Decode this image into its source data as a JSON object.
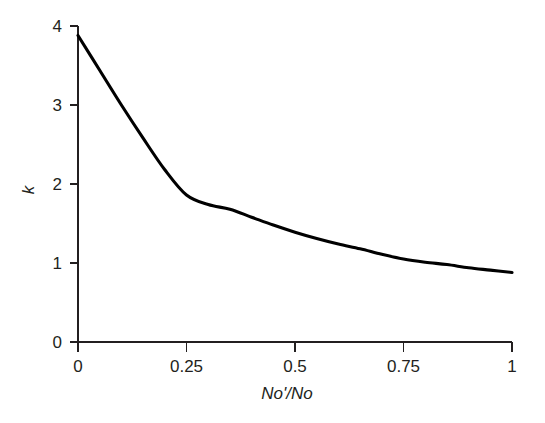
{
  "chart_data": {
    "type": "line",
    "title": "",
    "subtitle": "",
    "xlabel": "No'/No",
    "ylabel": "k",
    "xlim": [
      0,
      1
    ],
    "ylim": [
      0,
      4
    ],
    "grid": false,
    "legend": null,
    "legend_position": "none",
    "x_ticks": [
      0,
      0.25,
      0.5,
      0.75,
      1
    ],
    "x_tick_labels": [
      "0",
      "0.25",
      "0.5",
      "0.75",
      "1"
    ],
    "y_ticks": [
      0,
      1,
      2,
      3,
      4
    ],
    "y_tick_labels": [
      "0",
      "1",
      "2",
      "3",
      "4"
    ],
    "series": [
      {
        "name": "k",
        "color": "#000000",
        "x": [
          0.0,
          0.05,
          0.1,
          0.15,
          0.2,
          0.25,
          0.3,
          0.35,
          0.4,
          0.45,
          0.5,
          0.55,
          0.6,
          0.65,
          0.7,
          0.75,
          0.8,
          0.85,
          0.9,
          0.95,
          1.0
        ],
        "values": [
          3.88,
          3.44,
          3.0,
          2.58,
          2.18,
          1.86,
          1.74,
          1.68,
          1.58,
          1.48,
          1.39,
          1.31,
          1.24,
          1.18,
          1.11,
          1.05,
          1.01,
          0.98,
          0.94,
          0.91,
          0.88
        ]
      }
    ],
    "annotations": []
  },
  "axes": {
    "y_label": "k",
    "x_label": "No'/No",
    "y_tick_0": "0",
    "y_tick_1": "1",
    "y_tick_2": "2",
    "y_tick_3": "3",
    "y_tick_4": "4",
    "x_tick_0": "0",
    "x_tick_1": "0.25",
    "x_tick_2": "0.5",
    "x_tick_3": "0.75",
    "x_tick_4": "1"
  },
  "colors": {
    "background": "#ffffff",
    "axis": "#231f20",
    "curve": "#000000",
    "text": "#231f20"
  }
}
